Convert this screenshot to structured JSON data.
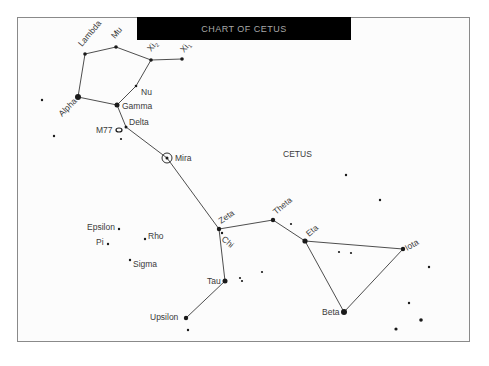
{
  "title": "CHART OF CETUS",
  "constellation_label": "CETUS",
  "colors": {
    "title_bg": "#000000",
    "title_text": "#a8a8a8",
    "frame": "#8a8a8a",
    "ink": "#1a1a1a"
  },
  "stars": [
    {
      "id": "lambda",
      "name": "Lambda",
      "x": 85,
      "y": 54,
      "r": 1.8,
      "label": {
        "x": 82,
        "y": 47,
        "rot": -50
      }
    },
    {
      "id": "mu",
      "name": "Mu",
      "x": 116,
      "y": 47,
      "r": 1.8,
      "label": {
        "x": 115,
        "y": 39,
        "rot": -50
      }
    },
    {
      "id": "xi2",
      "name": "Xi2",
      "x": 151,
      "y": 60,
      "r": 1.8,
      "label": {
        "x": 151,
        "y": 52,
        "rot": -50
      }
    },
    {
      "id": "xi1",
      "name": "Xi1",
      "x": 182,
      "y": 59,
      "r": 1.8,
      "label": {
        "x": 184,
        "y": 53,
        "rot": -50
      }
    },
    {
      "id": "nu",
      "name": "Nu",
      "x": 136,
      "y": 86,
      "r": 1.3,
      "label": {
        "x": 141,
        "y": 95,
        "rot": 0
      }
    },
    {
      "id": "alpha",
      "name": "Alpha",
      "x": 78,
      "y": 97,
      "r": 3,
      "label": {
        "x": 62,
        "y": 117,
        "rot": -45
      }
    },
    {
      "id": "gamma",
      "name": "Gamma",
      "x": 117,
      "y": 105,
      "r": 2.5,
      "label": {
        "x": 122,
        "y": 109,
        "rot": 0
      }
    },
    {
      "id": "delta",
      "name": "Delta",
      "x": 126,
      "y": 127,
      "r": 1.5,
      "label": {
        "x": 129,
        "y": 125,
        "rot": 0
      }
    },
    {
      "id": "mira",
      "name": "Mira",
      "x": 167,
      "y": 158,
      "r": 1.5,
      "ring": 5,
      "label": {
        "x": 175,
        "y": 161,
        "rot": 0
      }
    },
    {
      "id": "zeta",
      "name": "Zeta",
      "x": 219,
      "y": 229,
      "r": 2.2,
      "label": {
        "x": 221,
        "y": 224,
        "rot": -35
      }
    },
    {
      "id": "chi",
      "name": "Chi",
      "x": 222,
      "y": 233,
      "r": 1.2,
      "label": {
        "x": 221,
        "y": 240,
        "rot": 40
      }
    },
    {
      "id": "theta",
      "name": "Theta",
      "x": 273,
      "y": 220,
      "r": 2.2,
      "label": {
        "x": 276,
        "y": 215,
        "rot": -40
      }
    },
    {
      "id": "eta",
      "name": "Eta",
      "x": 305,
      "y": 241,
      "r": 2.6,
      "label": {
        "x": 309,
        "y": 237,
        "rot": -40
      }
    },
    {
      "id": "iota",
      "name": "Iota",
      "x": 403,
      "y": 249,
      "r": 2.2,
      "label": {
        "x": 407,
        "y": 251,
        "rot": -30
      }
    },
    {
      "id": "beta",
      "name": "Beta",
      "x": 344,
      "y": 312,
      "r": 3,
      "label": {
        "x": 322,
        "y": 315,
        "rot": 0
      }
    },
    {
      "id": "tau",
      "name": "Tau",
      "x": 225,
      "y": 281,
      "r": 2.5,
      "label": {
        "x": 207,
        "y": 284,
        "rot": 0
      }
    },
    {
      "id": "upsilon",
      "name": "Upsilon",
      "x": 186,
      "y": 318,
      "r": 2.2,
      "label": {
        "x": 150,
        "y": 320,
        "rot": 0
      }
    },
    {
      "id": "epsilon",
      "name": "Epsilon",
      "x": 119,
      "y": 229,
      "r": 1.2,
      "label": {
        "x": 87,
        "y": 230,
        "rot": 0
      }
    },
    {
      "id": "pi",
      "name": "Pi",
      "x": 108,
      "y": 244,
      "r": 1.2,
      "label": {
        "x": 96,
        "y": 245,
        "rot": 0
      }
    },
    {
      "id": "rho",
      "name": "Rho",
      "x": 145,
      "y": 239,
      "r": 1.2,
      "label": {
        "x": 148,
        "y": 239,
        "rot": 0
      }
    },
    {
      "id": "sigma",
      "name": "Sigma",
      "x": 130,
      "y": 260,
      "r": 1.2,
      "label": {
        "x": 133,
        "y": 267,
        "rot": 0
      }
    }
  ],
  "m77": {
    "name": "M77",
    "x": 119,
    "y": 130,
    "label": {
      "x": 96,
      "y": 133
    }
  },
  "field_stars": [
    {
      "x": 42,
      "y": 100,
      "r": 1.2
    },
    {
      "x": 54,
      "y": 136,
      "r": 1.2
    },
    {
      "x": 121,
      "y": 139,
      "r": 1.1
    },
    {
      "x": 188,
      "y": 330,
      "r": 1.2
    },
    {
      "x": 240,
      "y": 278,
      "r": 1.1
    },
    {
      "x": 242,
      "y": 281,
      "r": 1.1
    },
    {
      "x": 262,
      "y": 272,
      "r": 1.1
    },
    {
      "x": 291,
      "y": 224,
      "r": 1.1
    },
    {
      "x": 339,
      "y": 252,
      "r": 1.1
    },
    {
      "x": 351,
      "y": 253,
      "r": 1.1
    },
    {
      "x": 346,
      "y": 175,
      "r": 1.2
    },
    {
      "x": 380,
      "y": 200,
      "r": 1.2
    },
    {
      "x": 429,
      "y": 267,
      "r": 1.2
    },
    {
      "x": 409,
      "y": 303,
      "r": 1.2
    },
    {
      "x": 421,
      "y": 320,
      "r": 1.8
    },
    {
      "x": 396,
      "y": 329,
      "r": 1.6
    }
  ],
  "lines": [
    [
      "alpha",
      "lambda"
    ],
    [
      "lambda",
      "mu"
    ],
    [
      "mu",
      "xi2"
    ],
    [
      "xi2",
      "xi1"
    ],
    [
      "xi2",
      "nu"
    ],
    [
      "nu",
      "gamma"
    ],
    [
      "alpha",
      "gamma"
    ],
    [
      "gamma",
      "delta"
    ],
    [
      "delta",
      "mira"
    ],
    [
      "mira",
      "zeta"
    ],
    [
      "zeta",
      "theta"
    ],
    [
      "zeta",
      "tau"
    ],
    [
      "tau",
      "upsilon"
    ],
    [
      "theta",
      "eta"
    ],
    [
      "eta",
      "iota"
    ],
    [
      "eta",
      "beta"
    ],
    [
      "beta",
      "iota"
    ]
  ]
}
